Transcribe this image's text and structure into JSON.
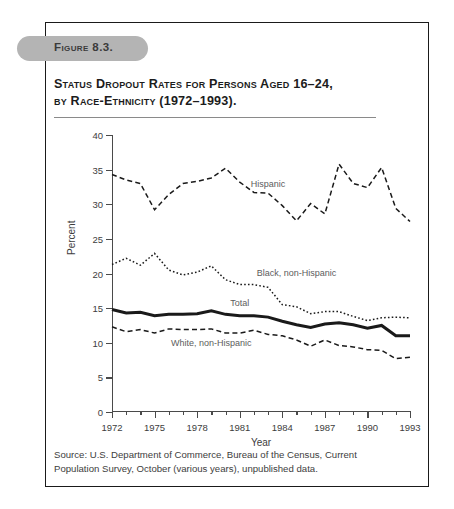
{
  "figure": {
    "pill_label": "Figure 8.3.",
    "title_line1": "Status Dropout Rates for Persons Aged 16–24,",
    "title_line2": "by Race-Ethnicity (1972–1993).",
    "source": "Source: U.S. Department of Commerce, Bureau of the Census, Current Population Survey, October (various years), unpublished data."
  },
  "chart_data": {
    "type": "line",
    "title": "Status Dropout Rates for Persons Aged 16–24, by Race-Ethnicity (1972–1993)",
    "xlabel": "Year",
    "ylabel": "Percent",
    "xlim": [
      1972,
      1993
    ],
    "ylim": [
      0,
      40
    ],
    "ytick_values": [
      0,
      5,
      10,
      15,
      20,
      25,
      30,
      35,
      40
    ],
    "ytick_labels": [
      "0",
      "5",
      "10",
      "15",
      "20",
      "25",
      "30",
      "35",
      "40"
    ],
    "xtick_major_values": [
      1972,
      1975,
      1978,
      1981,
      1984,
      1987,
      1990,
      1993
    ],
    "xtick_major_labels": [
      "1972",
      "1975",
      "1978",
      "1981",
      "1984",
      "1987",
      "1990",
      "1993"
    ],
    "xtick_minor_values": [
      1973,
      1974,
      1976,
      1977,
      1979,
      1980,
      1982,
      1983,
      1985,
      1986,
      1988,
      1989,
      1991,
      1992
    ],
    "grid": false,
    "legend_position": "inline-annotations",
    "x": [
      1972,
      1973,
      1974,
      1975,
      1976,
      1977,
      1978,
      1979,
      1980,
      1981,
      1982,
      1983,
      1984,
      1985,
      1986,
      1987,
      1988,
      1989,
      1990,
      1991,
      1992,
      1993
    ],
    "series": [
      {
        "name": "Hispanic",
        "style": "dashed",
        "label_x": 1983,
        "label_y": 32.8,
        "values": [
          34.3,
          33.5,
          33.0,
          29.2,
          31.4,
          33.0,
          33.3,
          33.8,
          35.2,
          33.2,
          31.7,
          31.6,
          29.8,
          27.6,
          30.1,
          28.6,
          35.8,
          33.0,
          32.4,
          35.3,
          29.4,
          27.5
        ]
      },
      {
        "name": "Black, non-Hispanic",
        "style": "dotted",
        "label_x": 1985,
        "label_y": 20.0,
        "values": [
          21.3,
          22.2,
          21.2,
          22.9,
          20.5,
          19.8,
          20.2,
          21.1,
          19.1,
          18.4,
          18.4,
          18.0,
          15.5,
          15.2,
          14.2,
          14.5,
          14.5,
          13.8,
          13.2,
          13.6,
          13.7,
          13.6
        ]
      },
      {
        "name": "Total",
        "style": "solid-bold",
        "label_x": 1981,
        "label_y": 15.6,
        "values": [
          14.8,
          14.3,
          14.4,
          13.9,
          14.1,
          14.1,
          14.2,
          14.6,
          14.1,
          13.9,
          13.9,
          13.7,
          13.1,
          12.6,
          12.2,
          12.7,
          12.9,
          12.6,
          12.1,
          12.5,
          11.0,
          11.0
        ]
      },
      {
        "name": "White, non-Hispanic",
        "style": "dashed",
        "label_x": 1979,
        "label_y": 9.8,
        "values": [
          12.3,
          11.6,
          11.9,
          11.4,
          12.0,
          11.9,
          11.9,
          12.0,
          11.4,
          11.4,
          11.8,
          11.2,
          11.0,
          10.4,
          9.5,
          10.4,
          9.6,
          9.4,
          9.0,
          8.9,
          7.7,
          7.9
        ]
      }
    ]
  }
}
